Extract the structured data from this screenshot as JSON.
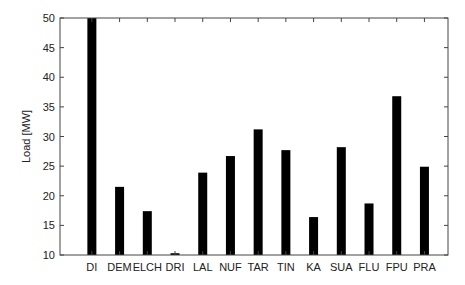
{
  "chart_data": {
    "type": "bar",
    "title": "",
    "xlabel": "",
    "ylabel": "Load [MW]",
    "ylim": [
      10,
      50
    ],
    "yticks": [
      10,
      15,
      20,
      25,
      30,
      35,
      40,
      45,
      50
    ],
    "grid": false,
    "legend": null,
    "bar_color": "#000000",
    "categories": [
      "DI",
      "DEM",
      "ELCH",
      "DRI",
      "LAL",
      "NUF",
      "TAR",
      "TIN",
      "KA",
      "SUA",
      "FLU",
      "FPU",
      "PRA"
    ],
    "values": [
      50,
      21.5,
      17.4,
      10.3,
      23.9,
      26.7,
      31.2,
      27.7,
      16.4,
      28.2,
      18.7,
      36.8,
      24.9
    ]
  }
}
